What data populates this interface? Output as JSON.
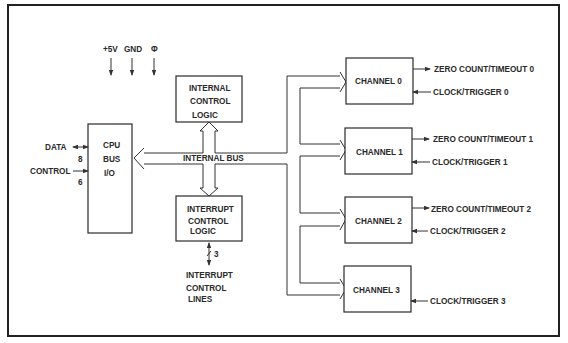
{
  "diagram": {
    "type": "block-diagram",
    "power_inputs": [
      "+5V",
      "GND",
      "Φ"
    ],
    "cpu_bus_io": {
      "lines": [
        "CPU",
        "BUS",
        "I/O"
      ]
    },
    "cpu_signals": {
      "data": {
        "label": "DATA",
        "width": "8"
      },
      "control": {
        "label": "CONTROL",
        "width": "6"
      }
    },
    "internal_control_logic": {
      "lines": [
        "INTERNAL",
        "CONTROL",
        "LOGIC"
      ]
    },
    "internal_bus_label": "INTERNAL BUS",
    "interrupt_control_logic": {
      "lines": [
        "INTERRUPT",
        "CONTROL",
        "LOGIC"
      ]
    },
    "interrupt_lines": {
      "width": "3",
      "lines": [
        "INTERRUPT",
        "CONTROL",
        "LINES"
      ]
    },
    "channels": [
      {
        "label": "CHANNEL 0",
        "output": "ZERO COUNT/TIMEOUT 0",
        "input": "CLOCK/TRIGGER 0"
      },
      {
        "label": "CHANNEL 1",
        "output": "ZERO COUNT/TIMEOUT 1",
        "input": "CLOCK/TRIGGER 1"
      },
      {
        "label": "CHANNEL 2",
        "output": "ZERO COUNT/TIMEOUT 2",
        "input": "CLOCK/TRIGGER 2"
      },
      {
        "label": "CHANNEL 3",
        "output": "",
        "input": "CLOCK/TRIGGER 3"
      }
    ],
    "colors": {
      "ink": "#2a2a2a",
      "background": "#ffffff"
    }
  }
}
